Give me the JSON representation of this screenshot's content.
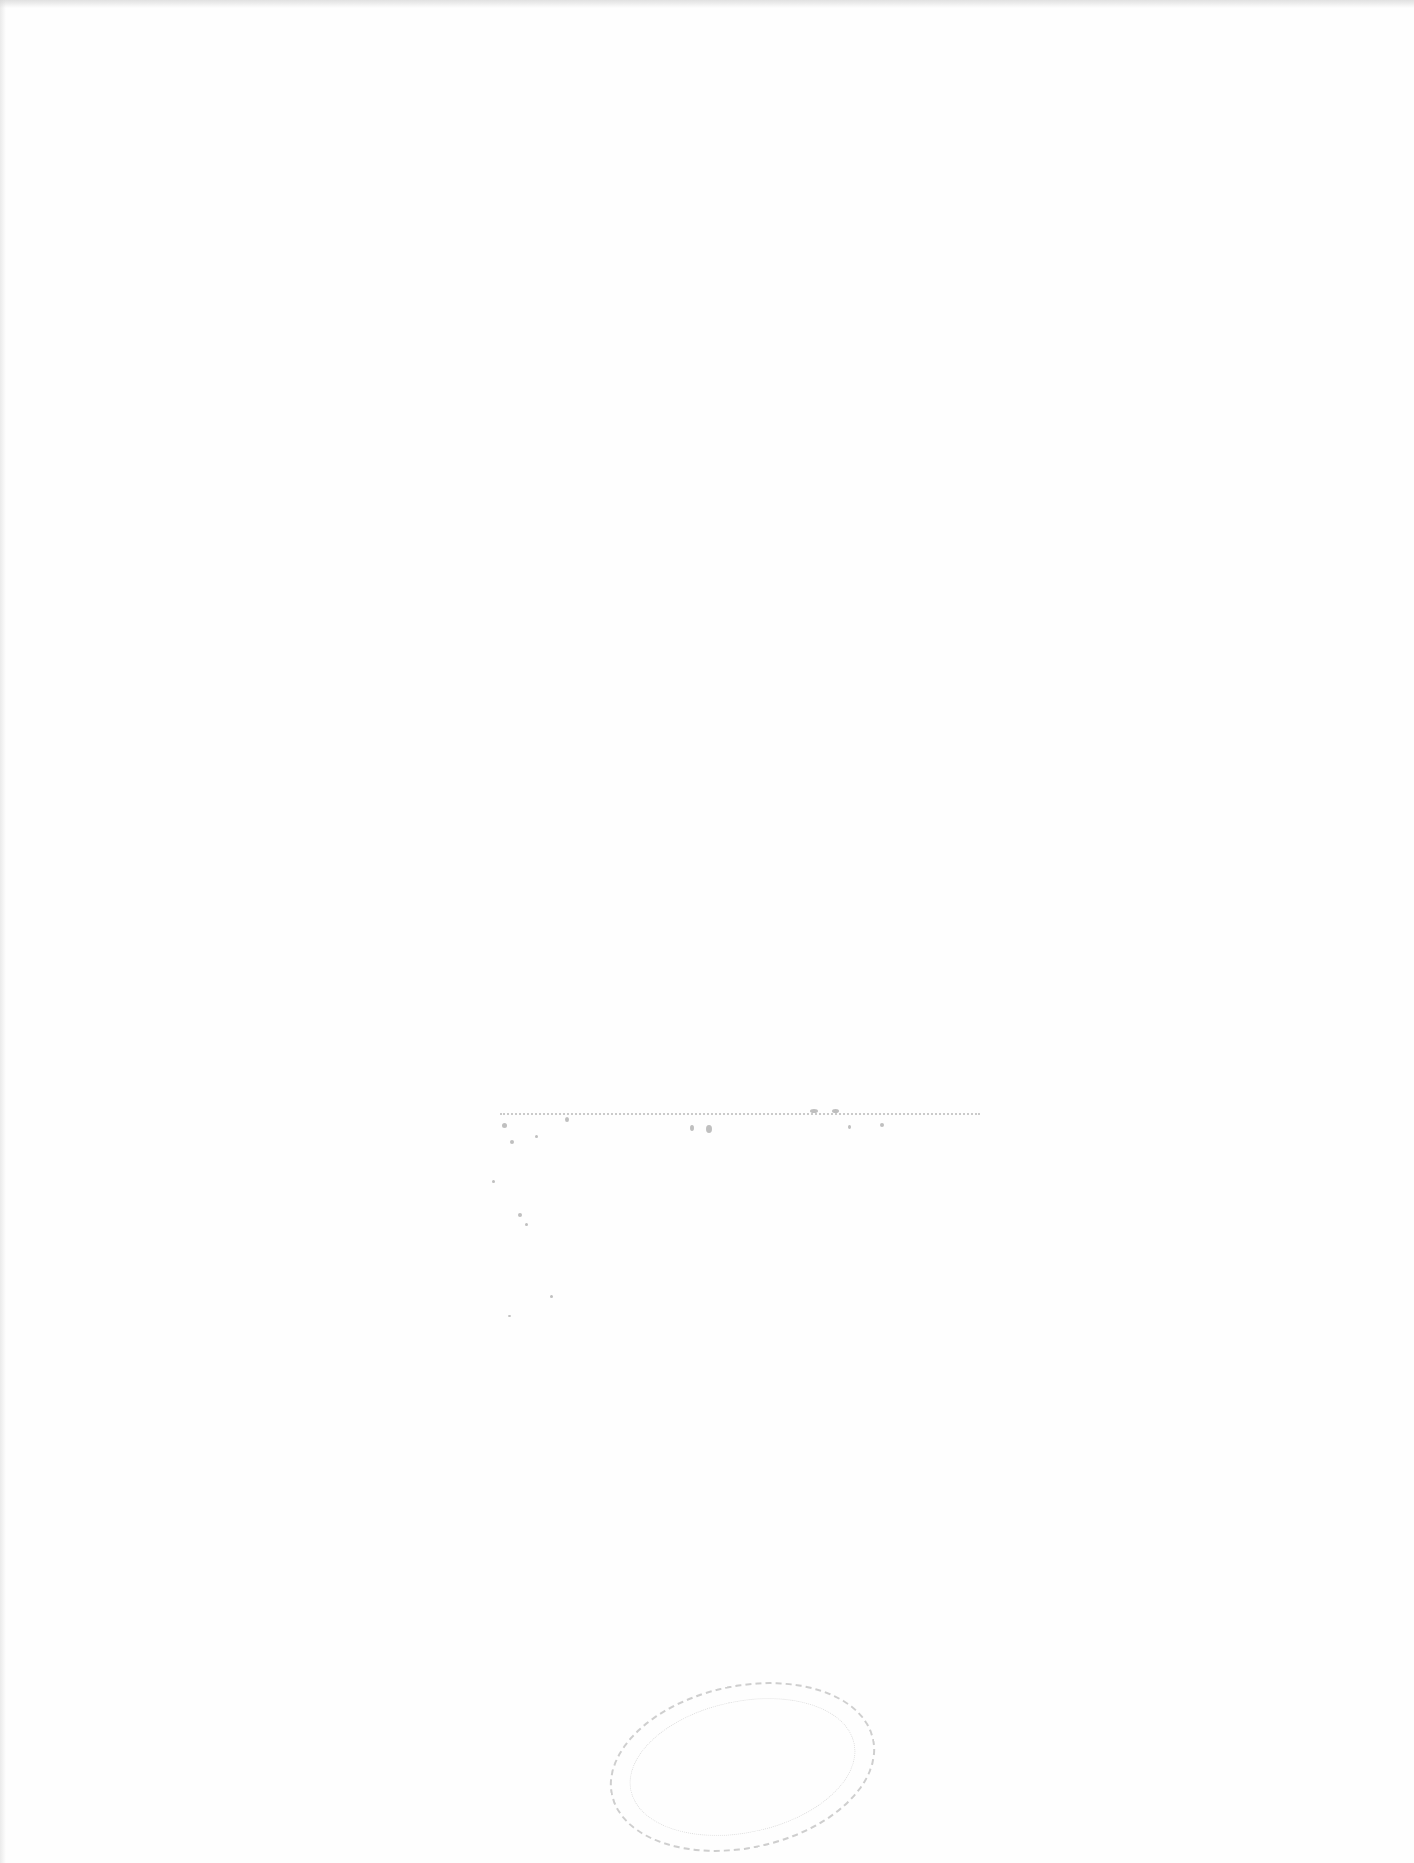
{
  "document": {
    "type": "scanned-page",
    "background_color": "#fefefe",
    "content": "blank page with faint illegible bleed-through marks",
    "bleed_through_text": "",
    "stamp": {
      "shape": "oval",
      "text": "",
      "color": "#969696"
    }
  }
}
